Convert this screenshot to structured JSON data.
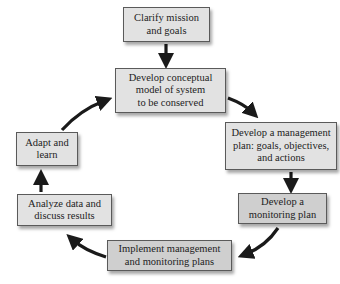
{
  "diagram": {
    "type": "cycle-flowchart",
    "nodes": [
      {
        "id": "clarify",
        "label": "Clarify mission\nand goals"
      },
      {
        "id": "conceptual",
        "label": "Develop conceptual\nmodel of system\nto be conserved"
      },
      {
        "id": "management",
        "label": "Develop a management\nplan: goals, objectives,\nand actions"
      },
      {
        "id": "monitoring",
        "label": "Develop a\nmonitoring plan"
      },
      {
        "id": "implement",
        "label": "Implement management\nand monitoring plans"
      },
      {
        "id": "analyze",
        "label": "Analyze data and\ndiscuss results"
      },
      {
        "id": "adapt",
        "label": "Adapt and\nlearn"
      }
    ],
    "edges": [
      {
        "from": "clarify",
        "to": "conceptual"
      },
      {
        "from": "conceptual",
        "to": "management"
      },
      {
        "from": "management",
        "to": "monitoring"
      },
      {
        "from": "monitoring",
        "to": "implement"
      },
      {
        "from": "implement",
        "to": "analyze"
      },
      {
        "from": "analyze",
        "to": "adapt"
      },
      {
        "from": "adapt",
        "to": "conceptual"
      }
    ],
    "colors": {
      "box_fill": "#e2e2e2",
      "box_fill_dark": "#cfcfcf",
      "box_border": "#5a5a5a",
      "arrow": "#1a1a1a",
      "text": "#222222"
    }
  }
}
